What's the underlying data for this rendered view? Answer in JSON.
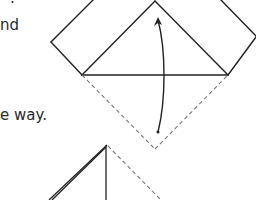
{
  "instruction_text": {
    "line_top_remnant": ".",
    "line_1_fragment": "nd",
    "line_2_fragment": "e way."
  },
  "diagram": {
    "figure_1": {
      "description": "Square rotated 45 degrees with upper triangle folded; arrow showing bottom triangle folded up along the horizontal line",
      "solid_color": "#222222",
      "dashed_color": "#777777",
      "fold_line": "horizontal",
      "arrow": "curved-up"
    },
    "figure_2": {
      "description": "Partial next step: triangle with thick folded left edge, vertical center line, dashed right edge",
      "solid_color": "#222222",
      "dashed_color": "#777777"
    }
  }
}
